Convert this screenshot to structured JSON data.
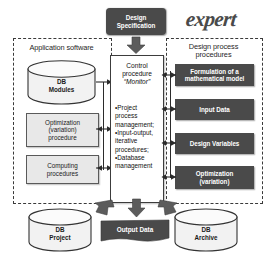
{
  "diagram": {
    "logo": "expert",
    "top_node": {
      "label": "Design\nSpecification",
      "line1": "Design",
      "line2": "Specification"
    },
    "left_panel": {
      "title": "Application software",
      "items": [
        {
          "kind": "cylinder",
          "name": "db-modules",
          "line1": "DB",
          "line2": "Modules"
        },
        {
          "kind": "box",
          "name": "optimization-procedure",
          "line1": "Optimization",
          "line2": "(variation)",
          "line3": "procedure"
        },
        {
          "kind": "box",
          "name": "computing-procedures",
          "line1": "Computing",
          "line2": "procedures"
        }
      ]
    },
    "center": {
      "title_line1": "Control",
      "title_line2": "procedure",
      "title_line3": "“Monitor”",
      "bullets": [
        "•Project",
        "process",
        "management;",
        "•Input-output,",
        "iterative",
        "procedures;",
        "•Database",
        "management"
      ]
    },
    "right_panel": {
      "title_line1": "Design process",
      "title_line2": "procedures",
      "items": [
        {
          "name": "formulation-of-mathematical-model",
          "line1": "Formulation of a",
          "line2": "mathematical model"
        },
        {
          "name": "input-data",
          "line1": "Input Data",
          "line2": ""
        },
        {
          "name": "design-variables",
          "line1": "Design Variables",
          "line2": ""
        },
        {
          "name": "optimization-variation",
          "line1": "Optimization",
          "line2": "(variation)"
        }
      ]
    },
    "bottom": {
      "db_project": {
        "line1": "DB",
        "line2": "Project"
      },
      "output_data": {
        "label": "Output Data"
      },
      "db_archive": {
        "line1": "DB",
        "line2": "Archive"
      }
    },
    "colors": {
      "dark_fill": "#4a4a4a",
      "light_fill": "#e8e8e8",
      "outline": "#3c3c3c",
      "dashed_border": "#3a3a3a",
      "arrow_fill": "#5c5c5c",
      "text_on_dark": "#ffffff",
      "background": "#ffffff"
    }
  }
}
